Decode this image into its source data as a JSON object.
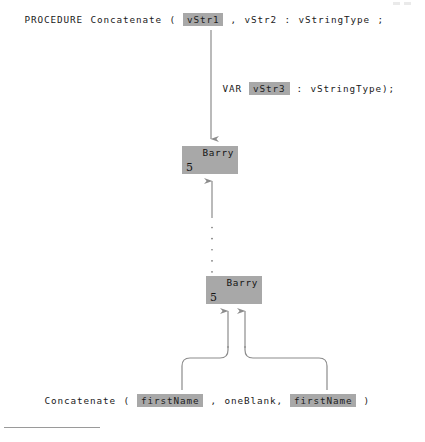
{
  "diagram": {
    "colors": {
      "highlight_bg": "#a8a8a8",
      "line": "#8c8c8c",
      "text": "#1a1a1a",
      "page_bg": "#ffffff"
    },
    "signature_line": {
      "keyword": "PROCEDURE",
      "name": "Concatenate",
      "open_paren": "(",
      "param1": "vStr1",
      "comma1": ",",
      "param2": "vStr2",
      "colon": ":",
      "type": "vStringType",
      "semicolon": ";"
    },
    "var_line": {
      "keyword": "VAR",
      "param3": "vStr3",
      "colon": ":",
      "type": "vStringType);"
    },
    "boxes": [
      {
        "name": "Barry",
        "length": "5"
      },
      {
        "name": "Barry",
        "length": "5"
      }
    ],
    "call_line": {
      "name": "Concatenate",
      "open_paren": "(",
      "arg1": "firstName",
      "comma1": ",",
      "arg2": "oneBlank,",
      "arg3": "firstName",
      "close_paren": ")"
    }
  }
}
